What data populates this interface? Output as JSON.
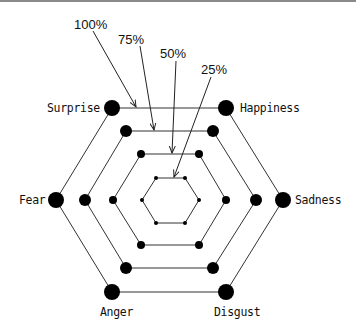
{
  "diagram": {
    "type": "hexagonal-radar-levels",
    "axes": [
      "Surprise",
      "Happiness",
      "Sadness",
      "Disgust",
      "Anger",
      "Fear"
    ],
    "levels": [
      {
        "label": "100%",
        "scale": 1.0
      },
      {
        "label": "75%",
        "scale": 0.75
      },
      {
        "label": "50%",
        "scale": 0.5
      },
      {
        "label": "25%",
        "scale": 0.25
      }
    ],
    "colors": {
      "line": "#333333",
      "dot": "#000000",
      "text": "#111111",
      "border": "#8a8a8a"
    }
  },
  "labels": {
    "surprise": "Surprise",
    "happiness": "Happiness",
    "sadness": "Sadness",
    "disgust": "Disgust",
    "anger": "Anger",
    "fear": "Fear",
    "p100": "100%",
    "p75": "75%",
    "p50": "50%",
    "p25": "25%"
  }
}
